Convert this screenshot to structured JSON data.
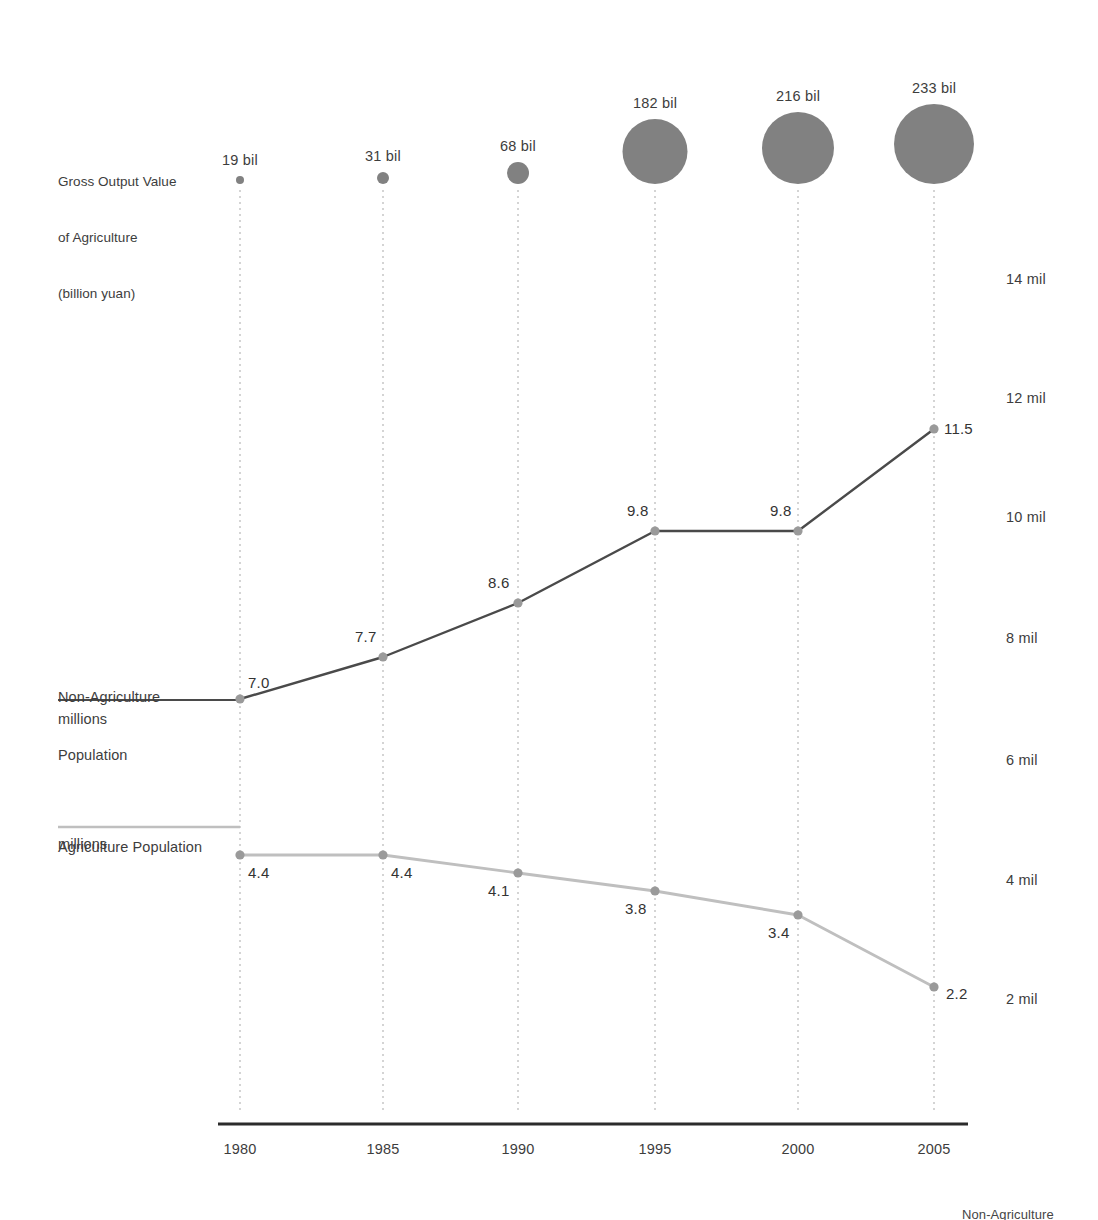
{
  "chart_data": {
    "type": "line",
    "title": "",
    "xlabel": "",
    "ylabel": "",
    "categories": [
      "1980",
      "1985",
      "1990",
      "1995",
      "2000",
      "2005"
    ],
    "x": [
      1980,
      1985,
      1990,
      1995,
      2000,
      2005
    ],
    "ylim": [
      0,
      15
    ],
    "grid": false,
    "legend_position": "left-inline",
    "y_axis_side": "right",
    "y_tick_labels": [
      "14 mil",
      "12 mil",
      "10 mil",
      "8 mil",
      "6 mil",
      "4 mil",
      "2 mil"
    ],
    "y_tick_values": [
      14,
      12,
      10,
      8,
      6,
      4,
      2
    ],
    "series": [
      {
        "name": "Non-Agriculture Population",
        "unit": "millions",
        "type": "line",
        "color": "#4a4a4a",
        "values": [
          7.0,
          7.7,
          8.6,
          9.8,
          9.8,
          11.5
        ],
        "value_labels": [
          "7.0",
          "7.7",
          "8.6",
          "9.8",
          "9.8",
          "11.5"
        ]
      },
      {
        "name": "Agriculture Population",
        "unit": "millions",
        "type": "line",
        "color": "#bfbfbf",
        "values": [
          4.4,
          4.4,
          4.1,
          3.8,
          3.4,
          2.2
        ],
        "value_labels": [
          "4.4",
          "4.4",
          "4.1",
          "3.8",
          "3.4",
          "2.2"
        ]
      },
      {
        "name": "Gross Output Value of Agriculture",
        "unit": "billion yuan",
        "type": "bubble",
        "color": "#818181",
        "values": [
          19,
          31,
          68,
          182,
          216,
          233
        ],
        "value_labels": [
          "19 bil",
          "31 bil",
          "68 bil",
          "182 bil",
          "216 bil",
          "233 bil"
        ],
        "radii": [
          4,
          6,
          11,
          32.5,
          36,
          40
        ]
      }
    ]
  },
  "legend": {
    "bubble_series": {
      "line1": "Gross Output Value",
      "line2": "of Agriculture",
      "line3": "(billion yuan)"
    },
    "nonagri": {
      "line1": "Non-Agriculture",
      "line2": "Population",
      "unit": "millions"
    },
    "agri": {
      "line1": "Agriculture Population",
      "unit": "millions"
    }
  },
  "footer": {
    "cut_label": "Non-Agriculture"
  },
  "colors": {
    "nonagri_line": "#4a4a4a",
    "agri_line": "#bfbfbf",
    "bubble_fill": "#818181",
    "marker_fill": "#9a9a9a",
    "axis_line": "#2b2b2b",
    "gridline": "#b8b8b8",
    "text": "#3d3d3d",
    "background": "#ffffff"
  }
}
